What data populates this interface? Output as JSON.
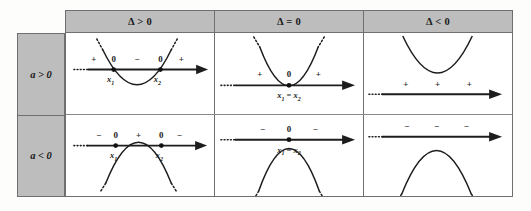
{
  "figure": {
    "title_visible": false,
    "corner_cell_label": "",
    "colors": {
      "header_bg": "#bdbdbd",
      "cell_bg": "#ffffff",
      "border": "#6f6f6f",
      "ink": "#1d1d1d"
    }
  },
  "columns": [
    {
      "id": "delta-positive",
      "label": "Δ > 0"
    },
    {
      "id": "delta-zero",
      "label": "Δ = 0"
    },
    {
      "id": "delta-negative",
      "label": "Δ < 0"
    }
  ],
  "rows": [
    {
      "id": "a-positive",
      "label": "a > 0"
    },
    {
      "id": "a-negative",
      "label": "a < 0"
    }
  ],
  "cells": {
    "a_pos_delta_pos": {
      "parabola": "opens-up-two-roots",
      "signs": [
        "+",
        "0",
        "−",
        "0",
        "+"
      ],
      "sign_left": "+",
      "sign_middle": "−",
      "sign_right": "+",
      "zero_left": "0",
      "zero_right": "0",
      "root_left": "x",
      "root_left_sub": "1",
      "root_right": "x",
      "root_right_sub": "2"
    },
    "a_pos_delta_zero": {
      "parabola": "opens-up-tangent",
      "signs": [
        "+",
        "0",
        "+"
      ],
      "sign_left": "+",
      "sign_right": "+",
      "zero_middle": "0",
      "root_label": "x",
      "root_sub_1": "1",
      "root_eq": " = ",
      "root_label_2": "x",
      "root_sub_2": "2"
    },
    "a_pos_delta_neg": {
      "parabola": "opens-up-no-roots",
      "signs": [
        "+",
        "+",
        "+"
      ]
    },
    "a_neg_delta_pos": {
      "parabola": "opens-down-two-roots",
      "signs": [
        "−",
        "0",
        "+",
        "0",
        "−"
      ],
      "sign_left": "−",
      "sign_middle": "+",
      "sign_right": "−",
      "zero_left": "0",
      "zero_right": "0",
      "root_left": "x",
      "root_left_sub": "1",
      "root_right": "x",
      "root_right_sub": "2"
    },
    "a_neg_delta_zero": {
      "parabola": "opens-down-tangent",
      "signs": [
        "−",
        "0",
        "−"
      ],
      "sign_left": "−",
      "sign_right": "−",
      "zero_middle": "0",
      "root_label": "x",
      "root_sub_1": "1",
      "root_eq": " = ",
      "root_label_2": "x",
      "root_sub_2": "2"
    },
    "a_neg_delta_neg": {
      "parabola": "opens-down-no-roots",
      "signs": [
        "−",
        "−",
        "−"
      ]
    }
  }
}
